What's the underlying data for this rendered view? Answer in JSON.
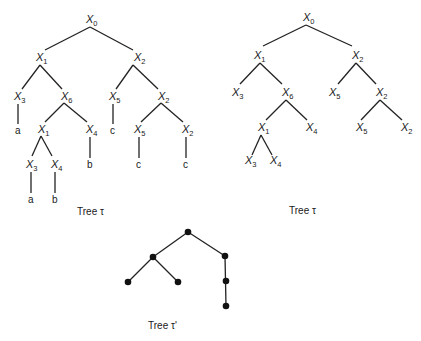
{
  "diagrams": {
    "left_tree": {
      "caption": "Tree τ",
      "nodes": [
        {
          "id": "l0",
          "label": "X",
          "sub": "0",
          "x": 90,
          "y": 20
        },
        {
          "id": "l1",
          "label": "X",
          "sub": "1",
          "x": 40,
          "y": 58
        },
        {
          "id": "l2",
          "label": "X",
          "sub": "2",
          "x": 138,
          "y": 58
        },
        {
          "id": "l3",
          "label": "X",
          "sub": "3",
          "x": 18,
          "y": 97
        },
        {
          "id": "l6",
          "label": "X",
          "sub": "6",
          "x": 65,
          "y": 97
        },
        {
          "id": "l5",
          "label": "X",
          "sub": "5",
          "x": 113,
          "y": 97
        },
        {
          "id": "l2b",
          "label": "X",
          "sub": "2",
          "x": 162,
          "y": 97
        },
        {
          "id": "l1b",
          "label": "X",
          "sub": "1",
          "x": 42,
          "y": 130
        },
        {
          "id": "l4",
          "label": "X",
          "sub": "4",
          "x": 90,
          "y": 130
        },
        {
          "id": "l5b",
          "label": "X",
          "sub": "5",
          "x": 138,
          "y": 130
        },
        {
          "id": "l2c",
          "label": "X",
          "sub": "2",
          "x": 186,
          "y": 130
        },
        {
          "id": "l3b",
          "label": "X",
          "sub": "3",
          "x": 30,
          "y": 165
        },
        {
          "id": "l4b",
          "label": "X",
          "sub": "4",
          "x": 55,
          "y": 165
        }
      ],
      "leaves": [
        {
          "id": "la",
          "text": "a",
          "x": 18,
          "y": 134
        },
        {
          "id": "lc1",
          "text": "c",
          "x": 113,
          "y": 134
        },
        {
          "id": "lb1",
          "text": "b",
          "x": 90,
          "y": 168
        },
        {
          "id": "lc2",
          "text": "c",
          "x": 138,
          "y": 168
        },
        {
          "id": "lc3",
          "text": "c",
          "x": 186,
          "y": 168
        },
        {
          "id": "la2",
          "text": "a",
          "x": 30,
          "y": 203
        },
        {
          "id": "lb2",
          "text": "b",
          "x": 55,
          "y": 203
        }
      ]
    },
    "right_tree": {
      "caption": "Tree τ",
      "nodes": [
        {
          "id": "r0",
          "label": "X",
          "sub": "0",
          "x": 307,
          "y": 20
        },
        {
          "id": "r1",
          "label": "X",
          "sub": "1",
          "x": 258,
          "y": 58
        },
        {
          "id": "r2",
          "label": "X",
          "sub": "2",
          "x": 356,
          "y": 58
        },
        {
          "id": "r3",
          "label": "X",
          "sub": "3",
          "x": 236,
          "y": 97
        },
        {
          "id": "r6",
          "label": "X",
          "sub": "6",
          "x": 286,
          "y": 97
        },
        {
          "id": "r5",
          "label": "X",
          "sub": "5",
          "x": 333,
          "y": 97
        },
        {
          "id": "r2b",
          "label": "X",
          "sub": "2",
          "x": 380,
          "y": 97
        },
        {
          "id": "r1b",
          "label": "X",
          "sub": "1",
          "x": 262,
          "y": 130
        },
        {
          "id": "r4",
          "label": "X",
          "sub": "4",
          "x": 310,
          "y": 130
        },
        {
          "id": "r5b",
          "label": "X",
          "sub": "5",
          "x": 358,
          "y": 130
        },
        {
          "id": "r2c",
          "label": "X",
          "sub": "2",
          "x": 405,
          "y": 130
        },
        {
          "id": "r3b",
          "label": "X",
          "sub": "3",
          "x": 250,
          "y": 165
        },
        {
          "id": "r4b",
          "label": "X",
          "sub": "4",
          "x": 275,
          "y": 165
        }
      ]
    },
    "bottom_tree": {
      "caption": "Tree τ'",
      "nodes": [
        {
          "id": "b0",
          "x": 188,
          "y": 232
        },
        {
          "id": "b1",
          "x": 153,
          "y": 257
        },
        {
          "id": "b2",
          "x": 225,
          "y": 256
        },
        {
          "id": "b3",
          "x": 128,
          "y": 282
        },
        {
          "id": "b4",
          "x": 178,
          "y": 282
        },
        {
          "id": "b5",
          "x": 226,
          "y": 281
        },
        {
          "id": "b6",
          "x": 226,
          "y": 306
        }
      ]
    }
  }
}
